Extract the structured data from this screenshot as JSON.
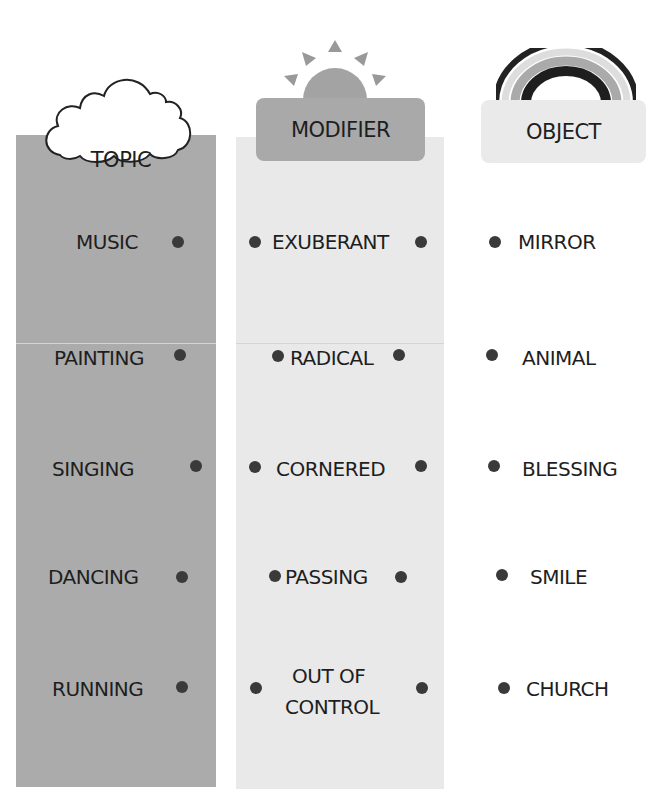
{
  "headers": {
    "topic": {
      "label": "TOPIC",
      "icon": "cloud-icon"
    },
    "modifier": {
      "label": "MODIFIER",
      "icon": "sun-icon"
    },
    "object": {
      "label": "OBJECT",
      "icon": "rainbow-icon"
    }
  },
  "topic": [
    "MUSIC",
    "PAINTING",
    "SINGING",
    "DANCING",
    "RUNNING"
  ],
  "modifier": [
    "EXUBERANT",
    "RADICAL",
    "CORNERED",
    "PASSING",
    "OUT OF",
    "CONTROL"
  ],
  "object": [
    "MIRROR",
    "ANIMAL",
    "BLESSING",
    "SMILE",
    "CHURCH"
  ],
  "colors": {
    "topic_column": "#ababab",
    "modifier_column": "#e9e9e9",
    "modifier_box": "#a9a9a9",
    "object_box": "#eaeaea",
    "dot": "#3a3a3a"
  }
}
